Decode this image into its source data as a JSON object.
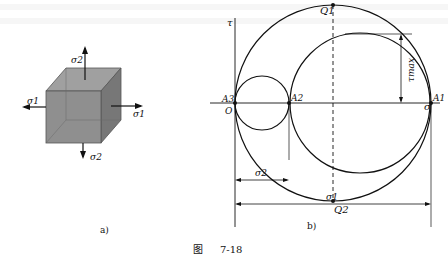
{
  "figure": {
    "caption_prefix": "图",
    "caption_number": "7-18",
    "panel_a": {
      "label": "a)",
      "element": "cube",
      "stresses": {
        "top": "σ2",
        "bottom": "σ2",
        "left": "σ1",
        "right": "σ1"
      },
      "cube_color": "#8f8f8f"
    },
    "panel_b": {
      "label": "b)",
      "axis_x": "σ",
      "axis_y": "τ",
      "origin": "O",
      "points": {
        "A3": "A3",
        "A2": "A2",
        "A1": "A1",
        "Q1": "Q1",
        "Q2": "Q2"
      },
      "dimensions": {
        "sigma2": "σ2",
        "sigma1": "σ1",
        "tau_max": "τmax"
      }
    }
  }
}
